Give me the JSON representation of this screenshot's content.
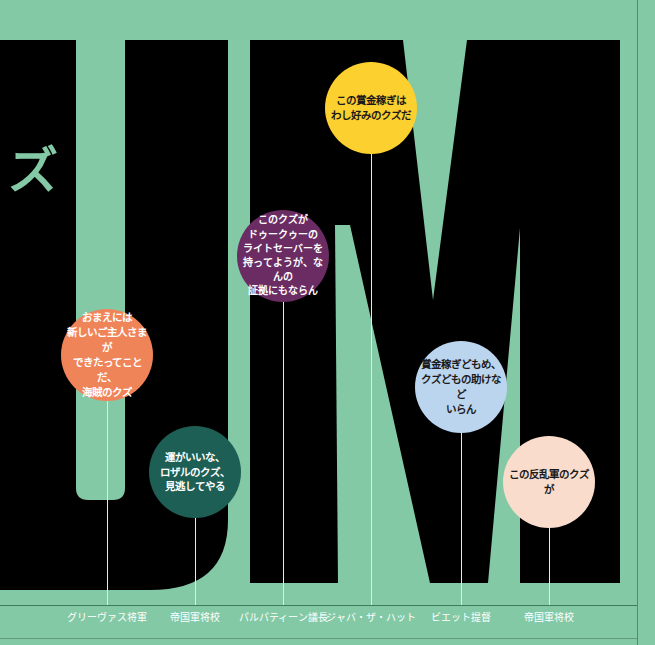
{
  "graphic": {
    "background_color": "#83c9a6",
    "letter_color": "#000000",
    "big_letters": "UM",
    "side_text": "ズ"
  },
  "callouts": [
    {
      "speaker": "グリーヴァス将軍",
      "quote": "おまえには\n新しいご主人さまが\nできたってことだ、\n海賊のクズ",
      "color": "#f08459",
      "text_color": "#ffffff",
      "x": 107,
      "cy": 355,
      "r": 46
    },
    {
      "speaker": "帝国軍将校",
      "quote": "運がいいな、\nロザルのクズ、\n見逃してやる",
      "color": "#1e5f55",
      "text_color": "#ffffff",
      "x": 195,
      "cy": 472,
      "r": 46
    },
    {
      "speaker": "パルパティーン議長",
      "quote": "このクズが\nドゥークゥーの\nライトセーバーを\n持ってようが、なんの\n証拠にもならん",
      "color": "#6a2c63",
      "text_color": "#ffffff",
      "x": 283,
      "cy": 256,
      "r": 46
    },
    {
      "speaker": "ジャバ・ザ・ハット",
      "quote": "この賞金稼ぎは\nわし好みのクズだ",
      "color": "#fcd02f",
      "text_color": "#1a1a1a",
      "x": 371,
      "cy": 108,
      "r": 46
    },
    {
      "speaker": "ビエット提督",
      "quote": "賞金稼ぎどもめ、\nクズどもの助けなど\nいらん",
      "color": "#bcd5ef",
      "text_color": "#1a1a1a",
      "x": 461,
      "cy": 387,
      "r": 46
    },
    {
      "speaker": "帝国軍将校",
      "quote": "この反乱軍のクズが",
      "color": "#f9dccc",
      "text_color": "#1a1a1a",
      "x": 549,
      "cy": 482,
      "r": 46
    }
  ]
}
